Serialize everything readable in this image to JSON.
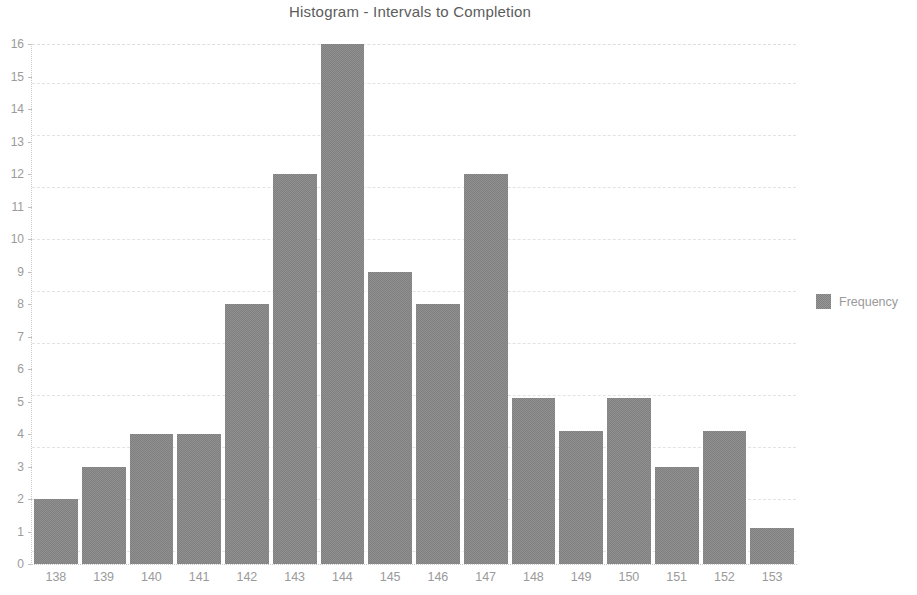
{
  "chart_data": {
    "type": "bar",
    "title": "Histogram - Intervals to Completion",
    "xlabel": "",
    "ylabel": "",
    "categories": [
      "138",
      "139",
      "140",
      "141",
      "142",
      "143",
      "144",
      "145",
      "146",
      "147",
      "148",
      "149",
      "150",
      "151",
      "152",
      "153"
    ],
    "values": [
      2,
      3,
      4,
      4,
      8,
      12,
      16,
      9,
      8,
      12,
      5.1,
      4.1,
      5.1,
      3,
      4.1,
      1.1
    ],
    "series": [
      {
        "name": "Frequency",
        "values": [
          2,
          3,
          4,
          4,
          8,
          12,
          16,
          9,
          8,
          12,
          5.1,
          4.1,
          5.1,
          3,
          4.1,
          1.1
        ]
      }
    ],
    "ylim": [
      0,
      16
    ],
    "y_ticks": [
      0,
      1,
      2,
      3,
      4,
      5,
      6,
      7,
      8,
      9,
      10,
      11,
      12,
      13,
      14,
      15,
      16
    ],
    "y_tick_labels": [
      "0",
      "1",
      "2",
      "3",
      "4",
      "5",
      "6",
      "7",
      "8",
      "9",
      "10",
      "11",
      "12",
      "13",
      "14",
      "15",
      "16"
    ],
    "grid": true,
    "grid_axis": "y",
    "legend": {
      "position": "right",
      "entries": [
        {
          "label": "Frequency",
          "color": "#808080"
        }
      ]
    },
    "colors": {
      "bar": "#808080",
      "text": "#9a9a9a",
      "title_text": "#5c5c5c",
      "gridline": "#e3e3e3",
      "axis": "#c9c9c9",
      "background": "#ffffff"
    }
  }
}
